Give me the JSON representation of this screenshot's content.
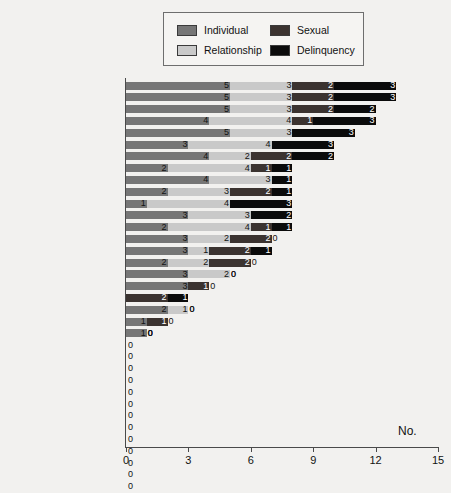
{
  "legend": {
    "items": [
      {
        "label": "Individual",
        "key": "individual",
        "color": "#767676"
      },
      {
        "label": "Relationship",
        "key": "relationship",
        "color": "#c9c9c9"
      },
      {
        "label": "Sexual",
        "key": "sexual",
        "color": "#3b3330"
      },
      {
        "label": "Delinquency",
        "key": "delinquency",
        "color": "#0b0b0b"
      }
    ]
  },
  "axis": {
    "title": "No.",
    "ticks": [
      "0",
      "3",
      "6",
      "9",
      "12",
      "15"
    ],
    "min": 0,
    "max": 15
  },
  "chart_data": {
    "type": "bar",
    "orientation": "horizontal",
    "stacked": true,
    "title": "",
    "xlabel": "No.",
    "ylabel": "",
    "xlim": [
      0,
      15
    ],
    "grid": false,
    "legend_position": "top-center",
    "series": [
      {
        "name": "Individual",
        "color": "#767676",
        "values": [
          5,
          5,
          5,
          4,
          5,
          3,
          4,
          2,
          4,
          2,
          1,
          3,
          2,
          3,
          3,
          2,
          3,
          3,
          0,
          2,
          1,
          1,
          0,
          0,
          0,
          0,
          0,
          0,
          0,
          0,
          0,
          0,
          0,
          0,
          0
        ]
      },
      {
        "name": "Relationship",
        "color": "#c9c9c9",
        "values": [
          3,
          3,
          3,
          4,
          3,
          4,
          2,
          4,
          3,
          3,
          4,
          3,
          4,
          2,
          1,
          2,
          2,
          0,
          0,
          1,
          0,
          0,
          0,
          0,
          0,
          0,
          0,
          0,
          0,
          0,
          0,
          0,
          0,
          0,
          0
        ]
      },
      {
        "name": "Sexual",
        "color": "#3b3330",
        "values": [
          2,
          2,
          2,
          1,
          0,
          0,
          2,
          1,
          0,
          2,
          0,
          0,
          1,
          2,
          2,
          2,
          0,
          1,
          2,
          0,
          1,
          0,
          0,
          0,
          0,
          0,
          0,
          0,
          0,
          0,
          0,
          0,
          0,
          0,
          0
        ]
      },
      {
        "name": "Delinquency",
        "color": "#0b0b0b",
        "values": [
          3,
          3,
          2,
          3,
          3,
          3,
          2,
          1,
          1,
          1,
          3,
          2,
          1,
          0,
          1,
          0,
          0,
          0,
          1,
          0,
          0,
          0,
          0,
          0,
          0,
          0,
          0,
          0,
          0,
          0,
          0,
          0,
          0,
          0,
          0
        ]
      }
    ],
    "categories": [
      "Denmark",
      "Isle of Man",
      "Finland",
      "Lithuania",
      "Ireland*",
      "Latvia",
      "United Kingdom",
      "Bulgaria",
      "Estonia",
      "Greenland",
      "Poland",
      "Russia (Moscow)",
      "Ukraine",
      "Faroe Islands",
      "Sweden",
      "Norway",
      "Slovak Republic",
      "Czech Republic",
      "Iceland",
      "Slovenia",
      "Austria",
      "Germany (6 Bundesl.)",
      "Belgium",
      "Croatia",
      "Cyprus",
      "France",
      "Greece",
      "Hungary",
      "Italy",
      "Malta",
      "Netherlands",
      "Portugal",
      "Romania",
      "Switzerland",
      "Turkey (6 cities)"
    ],
    "totals": [
      13,
      13,
      12,
      12,
      11,
      10,
      10,
      8,
      8,
      8,
      8,
      8,
      8,
      7,
      7,
      6,
      5,
      4,
      3,
      3,
      2,
      1,
      0,
      0,
      0,
      0,
      0,
      0,
      0,
      0,
      0,
      0,
      0,
      0,
      0
    ]
  }
}
